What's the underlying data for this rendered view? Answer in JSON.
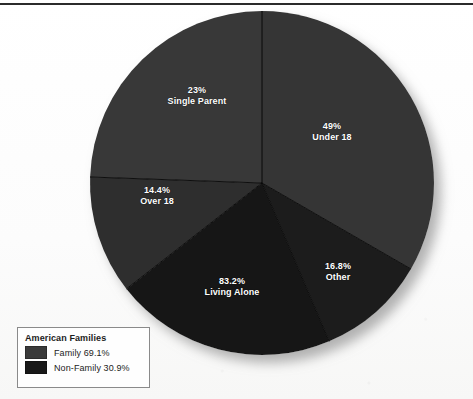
{
  "figure": {
    "has_top_rule": true,
    "background_color": "#fdfdfd"
  },
  "legend": {
    "title": "American Families",
    "items": [
      {
        "label": "Family 69.1%",
        "swatch_color": "#3a3a3a",
        "value": 69.1
      },
      {
        "label": "Non-Family 30.9%",
        "swatch_color": "#181818",
        "value": 30.9
      }
    ]
  },
  "chart_data": {
    "type": "pie",
    "title": "American Families",
    "xlabel": "",
    "ylabel": "",
    "legend_position": "bottom-left",
    "grid": false,
    "start_angle_deg": 0,
    "direction": "clockwise",
    "center": {
      "x": 262,
      "y": 183
    },
    "radius": 172,
    "categories": [
      "Under 18",
      "Other",
      "Living Alone",
      "Over 18",
      "Single Parent"
    ],
    "values": [
      49,
      16.8,
      83.2,
      14.4,
      23
    ],
    "value_labels": [
      "49%",
      "16.8%",
      "83.2%",
      "14.4%",
      "23%"
    ],
    "slices": [
      {
        "name": "Under 18",
        "percent_label": "49%",
        "value": 49,
        "group": "Family",
        "color": "#343434",
        "start_deg": 0,
        "end_deg": 120,
        "label_x": 332,
        "label_y": 132
      },
      {
        "name": "Other",
        "percent_label": "16.8%",
        "value": 16.8,
        "group": "Non-Family",
        "color": "#1e1e1e",
        "start_deg": 120,
        "end_deg": 157,
        "label_x": 338,
        "label_y": 272
      },
      {
        "name": "Living Alone",
        "percent_label": "83.2%",
        "value": 83.2,
        "group": "Non-Family",
        "color": "#181818",
        "start_deg": 157,
        "end_deg": 232,
        "label_x": 232,
        "label_y": 287
      },
      {
        "name": "Over 18",
        "percent_label": "14.4%",
        "value": 14.4,
        "group": "Family",
        "color": "#2e2e2e",
        "start_deg": 232,
        "end_deg": 272,
        "label_x": 157,
        "label_y": 196
      },
      {
        "name": "Single Parent",
        "percent_label": "23%",
        "value": 23,
        "group": "Family",
        "color": "#383838",
        "start_deg": 272,
        "end_deg": 360,
        "label_x": 197,
        "label_y": 96
      }
    ]
  }
}
